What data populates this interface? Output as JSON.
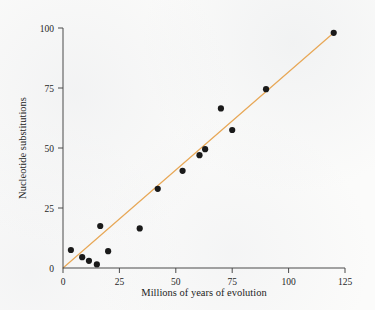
{
  "chart_data": {
    "type": "scatter",
    "title": "",
    "xlabel": "Millions of years of evolution",
    "ylabel": "Nucleotide substitutions",
    "xlim": [
      0,
      125
    ],
    "ylim": [
      0,
      100
    ],
    "xticks": [
      0,
      25,
      50,
      75,
      100,
      125
    ],
    "yticks": [
      0,
      25,
      50,
      75,
      100
    ],
    "xtick_labels": [
      "0",
      "25",
      "50",
      "75",
      "100",
      "125"
    ],
    "ytick_labels": [
      "0",
      "25",
      "50",
      "75",
      "100"
    ],
    "grid": false,
    "legend": null,
    "point_color": "#1a1a1a",
    "line_color": "#e8a857",
    "axis_color": "#4a4a4a",
    "background_color": "#fbfbfa",
    "points": [
      {
        "x": 3.5,
        "y": 7.5
      },
      {
        "x": 8.5,
        "y": 4.5
      },
      {
        "x": 11.5,
        "y": 3.0
      },
      {
        "x": 15.0,
        "y": 1.5
      },
      {
        "x": 16.5,
        "y": 17.5
      },
      {
        "x": 20.0,
        "y": 7.0
      },
      {
        "x": 34.0,
        "y": 16.5
      },
      {
        "x": 42.0,
        "y": 33.0
      },
      {
        "x": 53.0,
        "y": 40.5
      },
      {
        "x": 60.5,
        "y": 47.0
      },
      {
        "x": 63.0,
        "y": 49.5
      },
      {
        "x": 70.0,
        "y": 66.5
      },
      {
        "x": 75.0,
        "y": 57.5
      },
      {
        "x": 90.0,
        "y": 74.5
      },
      {
        "x": 120.0,
        "y": 98.0
      }
    ],
    "fit_line": {
      "x_start": 0,
      "y_start": 0,
      "x_end": 120,
      "y_end": 98,
      "description": "linear regression through origin"
    }
  }
}
